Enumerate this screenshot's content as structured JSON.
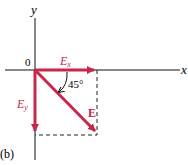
{
  "diagram": {
    "panel_label": "(b)",
    "axes": {
      "x_label": "x",
      "y_label": "y",
      "origin_label": "0"
    },
    "vectors": [
      {
        "name": "E_x",
        "label_main": "E",
        "label_sub": "x",
        "direction": "along +x"
      },
      {
        "name": "E_y",
        "label_main": "E",
        "label_sub": "y",
        "direction": "along -y"
      },
      {
        "name": "E",
        "label_main": "E",
        "direction": "45° below +x axis"
      }
    ],
    "angle_label": "45°",
    "colors": {
      "vector": "#c8264a",
      "axis": "#111111",
      "dashed": "#222222"
    }
  }
}
